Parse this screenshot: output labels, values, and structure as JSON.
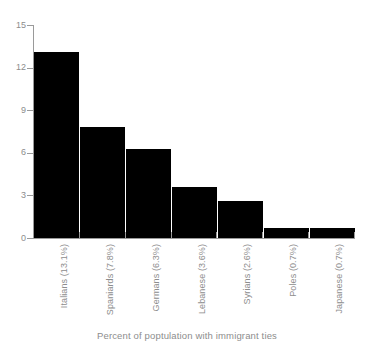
{
  "chart_data": {
    "type": "bar",
    "title": "",
    "subtitle": "",
    "xlabel": "Percent of poptulation with immigrant ties",
    "ylabel": "",
    "categories": [
      "Italians (13.1%)",
      "Spaniards (7.8%)",
      "Germans (6.3%)",
      "Lebanese (3.6%)",
      "Syrians (2.6%)",
      "Poles (0.7%)",
      "Japanese (0.7%)"
    ],
    "values": [
      13.1,
      7.8,
      6.3,
      3.6,
      2.6,
      0.7,
      0.7
    ],
    "ylim": [
      0,
      15
    ],
    "yticks": [
      "0",
      "3",
      "6",
      "9",
      "12",
      "15"
    ],
    "ytick_values": [
      0,
      3,
      6,
      9,
      12,
      15
    ],
    "grid": false,
    "legend": false,
    "legend_position": "none",
    "bar_color": "#000000",
    "axis_color": "#9a9a9a",
    "text_color": "#8d8d8d",
    "background_color": "#ffffff",
    "label_rotation": -90
  }
}
